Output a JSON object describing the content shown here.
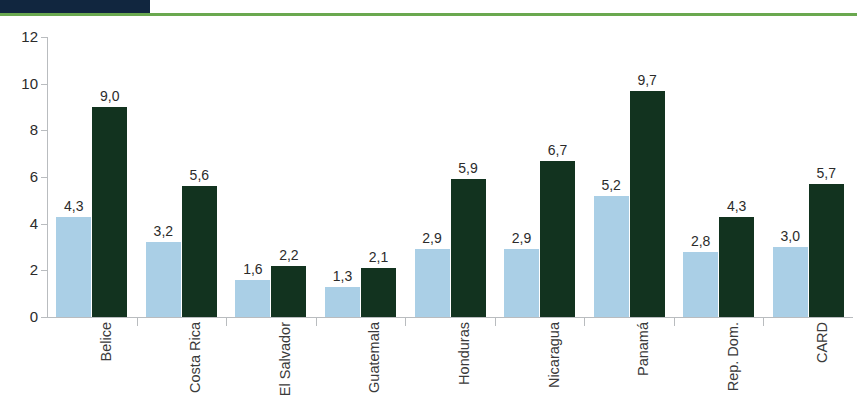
{
  "header": {
    "clipped_title": "",
    "dark_block_color": "#11263f",
    "rule_color": "#6aa84f"
  },
  "chart_data": {
    "type": "bar",
    "title": "",
    "subtitle": "",
    "xlabel": "",
    "ylabel": "",
    "ylim": [
      0,
      12
    ],
    "yticks": [
      0,
      2,
      4,
      6,
      8,
      10,
      12
    ],
    "ytick_labels": [
      "0",
      "2",
      "4",
      "6",
      "8",
      "10",
      "12"
    ],
    "grid": false,
    "legend_position": "none",
    "decimal_separator": ",",
    "categories": [
      "Belice",
      "Costa Rica",
      "El Salvador",
      "Guatemala",
      "Honduras",
      "Nicaragua",
      "Panamá",
      "Rep. Dom.",
      "CARD"
    ],
    "series": [
      {
        "name": "serie-1",
        "color": "#aacfe6",
        "values": [
          4.3,
          3.2,
          1.6,
          1.3,
          2.9,
          2.9,
          5.2,
          2.8,
          3.0
        ],
        "labels": [
          "4,3",
          "3,2",
          "1,6",
          "1,3",
          "2,9",
          "2,9",
          "5,2",
          "2,8",
          "3,0"
        ]
      },
      {
        "name": "serie-2",
        "color": "#12331f",
        "values": [
          9.0,
          5.6,
          2.2,
          2.1,
          5.9,
          6.7,
          9.7,
          4.3,
          5.7
        ],
        "labels": [
          "9,0",
          "5,6",
          "2,2",
          "2,1",
          "5,9",
          "6,7",
          "9,7",
          "4,3",
          "5,7"
        ]
      }
    ]
  },
  "colors": {
    "axis": "#b9bcbf",
    "text": "#2b2b2b",
    "series_1": "#aacfe6",
    "series_2": "#12331f"
  }
}
